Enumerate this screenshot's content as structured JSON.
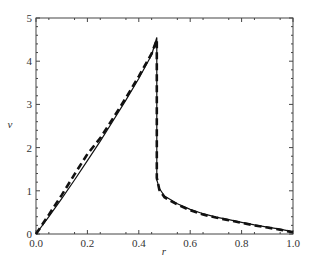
{
  "chart_data": {
    "type": "line",
    "title": "",
    "xlabel": "r",
    "ylabel": "v",
    "xlim": [
      0.0,
      1.0
    ],
    "ylim": [
      0,
      5
    ],
    "x_ticks": [
      "0.0",
      "0.2",
      "0.4",
      "0.6",
      "0.8",
      "1.0"
    ],
    "y_ticks": [
      "0",
      "1",
      "2",
      "3",
      "4",
      "5"
    ],
    "grid": false,
    "legend": "none",
    "series": [
      {
        "name": "solid",
        "style": "solid",
        "x": [
          0.0,
          0.05,
          0.1,
          0.15,
          0.2,
          0.25,
          0.3,
          0.35,
          0.4,
          0.45,
          0.47,
          0.47,
          0.48,
          0.5,
          0.55,
          0.6,
          0.65,
          0.7,
          0.75,
          0.8,
          0.85,
          0.9,
          0.95,
          1.0
        ],
        "values": [
          0.0,
          0.4,
          0.82,
          1.25,
          1.7,
          2.15,
          2.62,
          3.1,
          3.6,
          4.15,
          4.55,
          1.25,
          1.05,
          0.88,
          0.7,
          0.57,
          0.47,
          0.39,
          0.33,
          0.27,
          0.21,
          0.16,
          0.11,
          0.05
        ]
      },
      {
        "name": "dashed",
        "style": "dashed",
        "x": [
          0.0,
          0.05,
          0.1,
          0.15,
          0.2,
          0.25,
          0.3,
          0.35,
          0.4,
          0.45,
          0.47,
          0.47,
          0.48,
          0.5,
          0.55,
          0.6,
          0.65,
          0.7,
          0.75,
          0.8,
          0.85,
          0.9,
          0.95,
          1.0
        ],
        "values": [
          0.0,
          0.45,
          0.9,
          1.38,
          1.85,
          2.22,
          2.68,
          3.15,
          3.65,
          4.18,
          4.5,
          1.3,
          1.02,
          0.85,
          0.68,
          0.55,
          0.45,
          0.38,
          0.32,
          0.26,
          0.2,
          0.15,
          0.1,
          0.04
        ]
      }
    ]
  }
}
